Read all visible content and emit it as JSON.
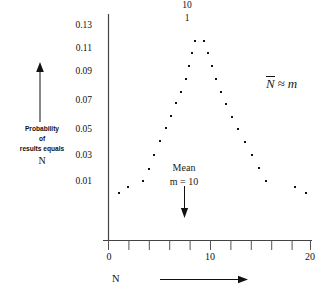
{
  "figure": {
    "title_fragment_top": "10",
    "title_fragment_top2": "1",
    "formula": {
      "nbar": "N",
      "approx": "≈",
      "m": "m"
    },
    "annotations": {
      "mean_line1": "Mean",
      "mean_line2": "m = 10",
      "x_axis_name": "N"
    },
    "y_axis_title": {
      "line1": "Probability",
      "line2": "of",
      "line3": "results equals",
      "line4": "N"
    }
  },
  "chart_data": {
    "type": "scatter",
    "title": "",
    "xlabel": "N",
    "ylabel": "Probability of results equals N",
    "xlim": [
      0,
      20
    ],
    "ylim": [
      0,
      0.14
    ],
    "grid": false,
    "legend": null,
    "xticks": [
      0,
      2,
      4,
      6,
      8,
      10,
      12,
      14,
      16,
      18,
      20
    ],
    "xticklabels": [
      "0",
      "",
      "",
      "",
      "",
      "10",
      "",
      "",
      "",
      "",
      "20"
    ],
    "yticks": [
      0.01,
      0.03,
      0.05,
      0.07,
      0.09,
      0.11,
      0.13
    ],
    "yticklabels": [
      "0.01",
      "0.03",
      "0.05",
      "0.07",
      "0.09",
      "0.11",
      "0.13"
    ],
    "annotations": [
      {
        "text": "Mean m = 10",
        "x": 10,
        "y": 0.035
      },
      {
        "text": "N̅ ≈ m",
        "x": 17.5,
        "y": 0.095
      }
    ],
    "series": [
      {
        "name": "Poisson m = 10",
        "marker": "square-dot",
        "color": "#111111",
        "points": [
          {
            "x": 1.0,
            "y": 0.0015
          },
          {
            "x": 1.9,
            "y": 0.0055
          },
          {
            "x": 3.4,
            "y": 0.0105
          },
          {
            "x": 4.0,
            "y": 0.02
          },
          {
            "x": 4.5,
            "y": 0.0305
          },
          {
            "x": 5.1,
            "y": 0.041
          },
          {
            "x": 5.7,
            "y": 0.051
          },
          {
            "x": 6.2,
            "y": 0.0605
          },
          {
            "x": 6.7,
            "y": 0.0705
          },
          {
            "x": 7.2,
            "y": 0.079
          },
          {
            "x": 7.7,
            "y": 0.0885
          },
          {
            "x": 8.0,
            "y": 0.0985
          },
          {
            "x": 8.3,
            "y": 0.1085
          },
          {
            "x": 8.6,
            "y": 0.118
          },
          {
            "x": 9.5,
            "y": 0.118
          },
          {
            "x": 9.9,
            "y": 0.1085
          },
          {
            "x": 10.2,
            "y": 0.0985
          },
          {
            "x": 10.6,
            "y": 0.089
          },
          {
            "x": 11.1,
            "y": 0.079
          },
          {
            "x": 11.6,
            "y": 0.07
          },
          {
            "x": 12.2,
            "y": 0.06
          },
          {
            "x": 12.8,
            "y": 0.0505
          },
          {
            "x": 13.5,
            "y": 0.0405
          },
          {
            "x": 14.2,
            "y": 0.0305
          },
          {
            "x": 14.9,
            "y": 0.0205
          },
          {
            "x": 15.6,
            "y": 0.0105
          },
          {
            "x": 18.5,
            "y": 0.0055
          },
          {
            "x": 19.6,
            "y": 0.0015
          }
        ]
      }
    ]
  }
}
